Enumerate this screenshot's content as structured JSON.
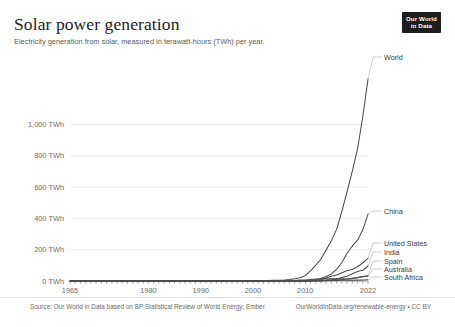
{
  "header": {
    "title": "Solar power generation",
    "subtitle": "Electricity generation from solar, measured in terawatt-hours (TWh) per year.",
    "logo_line1": "Our World",
    "logo_line2": "in Data"
  },
  "footer": {
    "source": "Source: Our World in Data based on BP Statistical Review of World Energy; Ember",
    "license": "OurWorldInData.org/renewable-energy • CC BY"
  },
  "colors": {
    "line": "#4a4a4a",
    "grid": "#e7e7e7",
    "axis_text": "#6b6b6b",
    "title": "#1d1d1d",
    "logo_bg": "#1d1d1d"
  },
  "chart_data": {
    "type": "line",
    "title": "Solar power generation",
    "subtitle": "Electricity generation from solar, measured in terawatt-hours (TWh) per year.",
    "xlabel": "",
    "ylabel": "TWh",
    "xlim": [
      1965,
      2022
    ],
    "ylim": [
      0,
      1000
    ],
    "grid": true,
    "legend_position": "right-end-labels",
    "ytick_labels": [
      "0 TWh",
      "200 TWh",
      "400 TWh",
      "600 TWh",
      "800 TWh",
      "1,000 TWh"
    ],
    "ytick_values": [
      0,
      200,
      400,
      600,
      800,
      1000
    ],
    "xtick_labels": [
      "1965",
      "1980",
      "1990",
      "2000",
      "2010",
      "2022"
    ],
    "xtick_values": [
      1965,
      1980,
      1990,
      2000,
      2010,
      2022
    ],
    "x": [
      1965,
      1966,
      1967,
      1968,
      1969,
      1970,
      1971,
      1972,
      1973,
      1974,
      1975,
      1976,
      1977,
      1978,
      1979,
      1980,
      1981,
      1982,
      1983,
      1984,
      1985,
      1986,
      1987,
      1988,
      1989,
      1990,
      1991,
      1992,
      1993,
      1994,
      1995,
      1996,
      1997,
      1998,
      1999,
      2000,
      2001,
      2002,
      2003,
      2004,
      2005,
      2006,
      2007,
      2008,
      2009,
      2010,
      2011,
      2012,
      2013,
      2014,
      2015,
      2016,
      2017,
      2018,
      2019,
      2020,
      2021,
      2022
    ],
    "series": [
      {
        "name": "World",
        "label": "World",
        "values": [
          0,
          0,
          0,
          0,
          0,
          0,
          0,
          0,
          0,
          0,
          0,
          0,
          0,
          0,
          0,
          0,
          0,
          0,
          0,
          0,
          0.1,
          0.2,
          0.3,
          0.4,
          0.5,
          0.6,
          0.7,
          0.8,
          0.9,
          1.0,
          1.1,
          1.2,
          1.3,
          1.5,
          1.7,
          1.9,
          2.2,
          2.5,
          3.0,
          3.9,
          5.1,
          6.9,
          9.6,
          13.9,
          21.0,
          33.6,
          65.1,
          100.5,
          140.2,
          199.0,
          258.0,
          330.0,
          445.0,
          572.0,
          702.0,
          844.0,
          1050.0,
          1290.0
        ]
      },
      {
        "name": "China",
        "label": "China",
        "values": [
          0,
          0,
          0,
          0,
          0,
          0,
          0,
          0,
          0,
          0,
          0,
          0,
          0,
          0,
          0,
          0,
          0,
          0,
          0,
          0,
          0,
          0,
          0,
          0,
          0,
          0,
          0,
          0,
          0,
          0,
          0,
          0,
          0,
          0,
          0,
          0,
          0,
          0,
          0,
          0.02,
          0.03,
          0.05,
          0.1,
          0.15,
          0.3,
          0.7,
          2.6,
          6.3,
          15.5,
          29.2,
          45.0,
          75.0,
          118.0,
          177.0,
          224.0,
          261.0,
          327.0,
          428.0
        ]
      },
      {
        "name": "United States",
        "label": "United States",
        "values": [
          0,
          0,
          0,
          0,
          0,
          0,
          0,
          0,
          0,
          0,
          0,
          0,
          0,
          0,
          0,
          0,
          0,
          0,
          0,
          0,
          0,
          0,
          0.4,
          0.4,
          0.4,
          0.4,
          0.5,
          0.5,
          0.5,
          0.5,
          0.5,
          0.5,
          0.5,
          0.5,
          0.5,
          0.5,
          0.5,
          0.6,
          0.6,
          0.6,
          0.6,
          0.6,
          0.6,
          0.9,
          1.2,
          1.8,
          3.0,
          5.3,
          9.6,
          19.8,
          30.0,
          38.5,
          53.0,
          67.0,
          74.0,
          91.0,
          115.0,
          145.0
        ]
      },
      {
        "name": "India",
        "label": "India",
        "values": [
          0,
          0,
          0,
          0,
          0,
          0,
          0,
          0,
          0,
          0,
          0,
          0,
          0,
          0,
          0,
          0,
          0,
          0,
          0,
          0,
          0,
          0,
          0,
          0,
          0,
          0,
          0,
          0,
          0,
          0,
          0,
          0,
          0,
          0,
          0,
          0,
          0,
          0,
          0,
          0,
          0.01,
          0.02,
          0.03,
          0.04,
          0.05,
          0.1,
          0.5,
          1.1,
          2.4,
          4.7,
          8.0,
          12.1,
          21.6,
          31.0,
          46.3,
          60.4,
          68.3,
          96.0
        ]
      },
      {
        "name": "Spain",
        "label": "Spain",
        "values": [
          0,
          0,
          0,
          0,
          0,
          0,
          0,
          0,
          0,
          0,
          0,
          0,
          0,
          0,
          0,
          0,
          0,
          0,
          0,
          0,
          0,
          0,
          0,
          0,
          0,
          0,
          0,
          0,
          0,
          0,
          0,
          0,
          0,
          0,
          0,
          0,
          0,
          0,
          0.01,
          0.02,
          0.04,
          0.1,
          0.5,
          2.5,
          6.1,
          6.4,
          9.1,
          12.1,
          13.6,
          13.7,
          13.9,
          13.8,
          14.0,
          12.8,
          15.1,
          20.9,
          27.1,
          32.7
        ]
      },
      {
        "name": "Australia",
        "label": "Australia",
        "values": [
          0,
          0,
          0,
          0,
          0,
          0,
          0,
          0,
          0,
          0,
          0,
          0,
          0,
          0,
          0,
          0,
          0,
          0,
          0,
          0,
          0,
          0,
          0,
          0,
          0,
          0,
          0,
          0,
          0,
          0,
          0,
          0,
          0,
          0,
          0,
          0,
          0,
          0,
          0,
          0,
          0.02,
          0.03,
          0.05,
          0.1,
          0.2,
          0.4,
          1.0,
          2.0,
          3.8,
          5.0,
          6.2,
          7.4,
          9.2,
          13.0,
          18.0,
          23.0,
          28.0,
          32.0
        ]
      },
      {
        "name": "South Africa",
        "label": "South Africa",
        "values": [
          0,
          0,
          0,
          0,
          0,
          0,
          0,
          0,
          0,
          0,
          0,
          0,
          0,
          0,
          0,
          0,
          0,
          0,
          0,
          0,
          0,
          0,
          0,
          0,
          0,
          0,
          0,
          0,
          0,
          0,
          0,
          0,
          0,
          0,
          0,
          0,
          0,
          0,
          0,
          0,
          0,
          0,
          0,
          0,
          0,
          0,
          0,
          0,
          0.1,
          1.1,
          2.7,
          3.5,
          4.2,
          4.9,
          5.4,
          5.7,
          6.2,
          7.4
        ]
      }
    ],
    "end_labels": [
      {
        "name": "World",
        "y_px": 57
      },
      {
        "name": "China",
        "y_px": 211
      },
      {
        "name": "United States",
        "y_px": 243
      },
      {
        "name": "India",
        "y_px": 252
      },
      {
        "name": "Spain",
        "y_px": 261
      },
      {
        "name": "Australia",
        "y_px": 269
      },
      {
        "name": "South Africa",
        "y_px": 277
      }
    ]
  }
}
